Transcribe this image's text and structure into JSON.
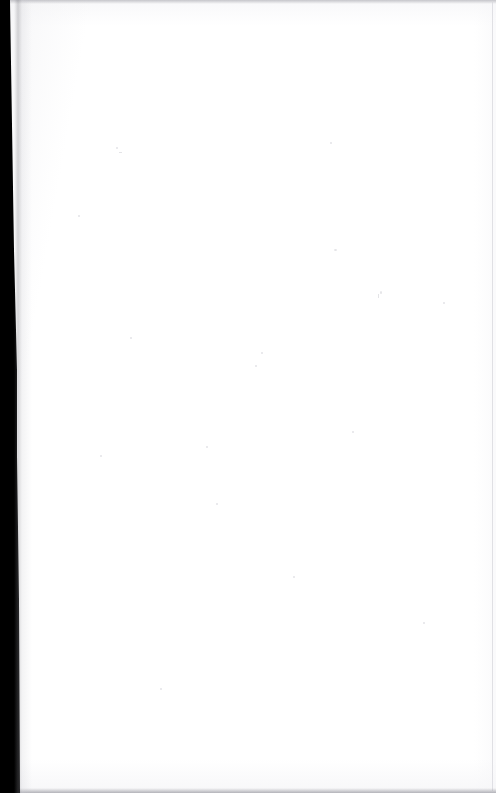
{
  "document": {
    "kind": "scanned-page",
    "page_content": "",
    "page_note": "Blank page",
    "width_px": 496,
    "height_px": 793
  },
  "colors": {
    "paper": "#ffffff",
    "scanner_bed": "#000000",
    "edge_shadow": "#b0b0b6",
    "bottom_edge": "#a0a0a7",
    "right_rule": "#d6d6db",
    "speckle": "#cdcdd4"
  },
  "regions": {
    "scanner_margin_label": "",
    "top_edge_label": "",
    "bottom_edge_label": "",
    "right_rule_label": ""
  }
}
